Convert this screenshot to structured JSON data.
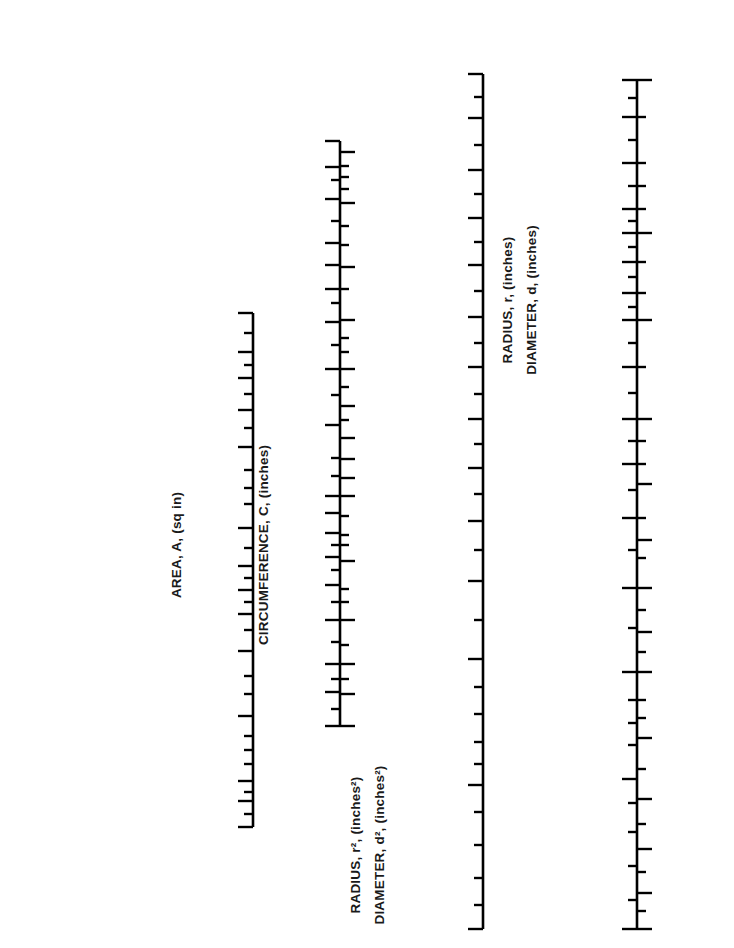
{
  "figure": {
    "type": "nomogram"
  },
  "formulas": [
    {
      "id": "f1",
      "lines": [
        "C = 6.2832r",
        "r = C/6.2832"
      ],
      "marker": "crosshair-icon"
    },
    {
      "id": "f2",
      "lines": [
        "C = 3.1416d",
        "d = C/3.1416"
      ],
      "marker": "crosshair-icon"
    },
    {
      "id": "f3",
      "lines": [
        "A = 7.854d",
        "2"
      ],
      "text": "A = 7.854d²",
      "marker": "crosshair-icon"
    },
    {
      "id": "f4",
      "lines": [
        "A = 3.1416r",
        "2"
      ],
      "text": "A = 3.1416r²",
      "marker": "crosshair-icon"
    }
  ],
  "examples": [
    {
      "label": "EXAMPLE 2",
      "id": "example-2"
    },
    {
      "label": "EXAMPLE 1",
      "id": "example-1"
    }
  ],
  "badges": [
    {
      "n": "1",
      "cx": 94,
      "cy": 193
    },
    {
      "n": "2",
      "cx": 245,
      "cy": 292
    },
    {
      "n": "3",
      "cx": 316,
      "cy": 110
    },
    {
      "n": "4",
      "cx": 357,
      "cy": 110
    },
    {
      "n": "5",
      "cx": 470,
      "cy": 44
    },
    {
      "n": "6",
      "cx": 608,
      "cy": 51
    },
    {
      "n": "7",
      "cx": 688,
      "cy": 51
    }
  ],
  "chart_data": {
    "type": "nomogram",
    "scales": [
      {
        "index": "2",
        "name": "AREA",
        "axis_title": "AREA, A, (sq in)",
        "unit": "sq in",
        "x": 253,
        "y_top": 313,
        "y_bottom": 827,
        "labels_side": "left",
        "major": [
          {
            "v": "700.0",
            "y": 313
          },
          {
            "v": "500.0",
            "y": 352
          },
          {
            "v": "400.0",
            "y": 378
          },
          {
            "v": "300.0",
            "y": 410
          },
          {
            "v": "200.0",
            "y": 447
          },
          {
            "v": "100.0",
            "y": 528
          },
          {
            "v": "50.0",
            "y": 566
          },
          {
            "v": "40.0",
            "y": 590
          },
          {
            "v": "30.0",
            "y": 614
          },
          {
            "v": "20.0",
            "y": 651
          },
          {
            "v": "10.0",
            "y": 716
          },
          {
            "v": "5.0",
            "y": 781
          },
          {
            "v": "4.0",
            "y": 801
          },
          {
            "v": "3.0",
            "y": 827
          }
        ],
        "minor_y": [
          333,
          365,
          394,
          428,
          470,
          488,
          504,
          548,
          578,
          602,
          630,
          676,
          694,
          736,
          750,
          764,
          792,
          814
        ]
      },
      {
        "index": "3",
        "name": "CIRCUMFERENCE",
        "axis_title": "CIRCUMFERENCE, C, (inches)",
        "unit": "inches",
        "x": 340,
        "y_top": 141,
        "y_bottom": 726,
        "labels_side": "left",
        "major": [
          {
            "v": "70.0",
            "y": 141
          },
          {
            "v": "60.0",
            "y": 167
          },
          {
            "v": "50.0",
            "y": 199
          },
          {
            "v": "40.0",
            "y": 243
          },
          {
            "v": "35.0",
            "y": 265
          },
          {
            "v": "30.0",
            "y": 289
          },
          {
            "v": "25.0",
            "y": 322
          },
          {
            "v": "20.0",
            "y": 369
          },
          {
            "v": "15.0",
            "y": 425
          },
          {
            "v": "10.0",
            "y": 496
          },
          {
            "v": "9.0",
            "y": 513
          },
          {
            "v": "8.0",
            "y": 533
          },
          {
            "v": "7.0",
            "y": 557
          },
          {
            "v": "6.0",
            "y": 585
          },
          {
            "v": "5.0",
            "y": 620
          },
          {
            "v": "4.0",
            "y": 664
          },
          {
            "v": "3.5",
            "y": 692
          },
          {
            "v": "3.0",
            "y": 726
          }
        ],
        "minor_y": [
          180,
          221,
          303,
          345,
          395,
          458,
          476,
          545,
          570,
          602,
          642,
          679,
          709
        ]
      },
      {
        "index": "4",
        "name": "RADIUS / DIAMETER",
        "axis_title_lines": [
          "RADIUS, r, (inches)",
          "DIAMETER, d, (inches)"
        ],
        "unit": "inches",
        "x": 340,
        "y_top": 141,
        "y_bottom": 726,
        "labels_side": "right",
        "major": [
          {
            "v": "0.15",
            "y": 152
          },
          {
            "v": "0.20",
            "y": 203
          },
          {
            "v": "0.30",
            "y": 267
          },
          {
            "v": "0.40",
            "y": 320
          },
          {
            "v": "0.50",
            "y": 369
          },
          {
            "v": "0.60",
            "y": 406
          },
          {
            "v": "0.70",
            "y": 438
          },
          {
            "v": "0.80",
            "y": 459
          },
          {
            "v": "0.90",
            "y": 478
          },
          {
            "v": "1.00",
            "y": 496
          },
          {
            "v": "1.50",
            "y": 561
          },
          {
            "v": "2.00",
            "y": 620
          },
          {
            "v": "2.50",
            "y": 664
          },
          {
            "v": "3.00",
            "y": 694
          },
          {
            "v": "3.50",
            "y": 726
          }
        ],
        "minor_y": [
          166,
          177,
          189,
          226,
          245,
          289,
          338,
          352,
          387,
          420,
          516,
          535,
          545,
          589,
          602,
          645,
          679
        ]
      },
      {
        "index": "5",
        "name": "RADIUS² / DIAMETER²",
        "axis_title_lines": [
          "RADIUS, r², (inches²)",
          "DIAMETER, d², (inches²)"
        ],
        "unit": "inches2",
        "x": 483,
        "y_top": 74,
        "y_bottom": 929,
        "labels_side": "left",
        "major": [
          {
            "v": "10.0",
            "y": 74
          },
          {
            "v": "9.0",
            "y": 118
          },
          {
            "v": "8.0",
            "y": 170
          },
          {
            "v": "7.0",
            "y": 218
          },
          {
            "v": "6.0",
            "y": 265
          },
          {
            "v": "5.0",
            "y": 317
          },
          {
            "v": "4.5",
            "y": 367
          },
          {
            "v": "4.0",
            "y": 419
          },
          {
            "v": "3.5",
            "y": 468
          },
          {
            "v": "3.0",
            "y": 521
          },
          {
            "v": "2.5",
            "y": 581
          },
          {
            "v": "2.0",
            "y": 659
          },
          {
            "v": "1.5",
            "y": 785
          },
          {
            "v": "1.0",
            "y": 929
          }
        ],
        "minor_y": [
          97,
          145,
          194,
          242,
          291,
          343,
          394,
          444,
          494,
          550,
          620,
          687,
          714,
          742,
          764,
          812,
          845,
          878,
          905
        ]
      },
      {
        "index": "6",
        "name": "RADIUS / DIAMETER",
        "axis_title_lines": [
          "RADIUS, r, (inches)",
          "DIAMETER, d, (inches)"
        ],
        "unit": "inches",
        "x": 637,
        "y_top": 80,
        "y_bottom": 929,
        "labels_side": "left",
        "major": [
          {
            "v": "10.00",
            "y": 80
          },
          {
            "v": "9.00",
            "y": 117
          },
          {
            "v": "8.00",
            "y": 163
          },
          {
            "v": "7.00",
            "y": 209
          },
          {
            "v": "6.50",
            "y": 233
          },
          {
            "v": "6.00",
            "y": 262
          },
          {
            "v": "5.50",
            "y": 293
          },
          {
            "v": "5.00",
            "y": 320
          },
          {
            "v": "4.50",
            "y": 367
          },
          {
            "v": "4.00",
            "y": 419
          },
          {
            "v": "3.50",
            "y": 464
          },
          {
            "v": "3.00",
            "y": 518
          },
          {
            "v": "2.50",
            "y": 588
          },
          {
            "v": "2.00",
            "y": 672
          },
          {
            "v": "1.50",
            "y": 779
          },
          {
            "v": "1.00",
            "y": 929
          }
        ],
        "minor_y": [
          98,
          140,
          186,
          221,
          247,
          277,
          307,
          343,
          393,
          441,
          490,
          550,
          628,
          700,
          723,
          745,
          803,
          832,
          866,
          900
        ]
      },
      {
        "index": "7",
        "name": "CIRCUMFERENCE",
        "axis_title": "CIRCUMFERENCE, C, (inches)",
        "unit": "inches",
        "x": 637,
        "y_top": 80,
        "y_bottom": 929,
        "labels_side": "right",
        "major": [
          {
            "v": "1.00",
            "y": 80
          },
          {
            "v": "1.50",
            "y": 233
          },
          {
            "v": "2.00",
            "y": 320
          },
          {
            "v": "2.50",
            "y": 419
          },
          {
            "v": "3.00",
            "y": 484
          },
          {
            "v": "3.50",
            "y": 540
          },
          {
            "v": "4.00",
            "y": 588
          },
          {
            "v": "4.50",
            "y": 632
          },
          {
            "v": "5.00",
            "y": 672
          },
          {
            "v": "6.00",
            "y": 738
          },
          {
            "v": "7.00",
            "y": 799
          },
          {
            "v": "8.00",
            "y": 849
          },
          {
            "v": "9.00",
            "y": 893
          },
          {
            "v": "10.00",
            "y": 929
          }
        ],
        "minor_y": [
          117,
          163,
          186,
          209,
          262,
          293,
          367,
          441,
          464,
          518,
          558,
          610,
          652,
          700,
          718,
          769,
          824,
          872,
          911
        ]
      }
    ],
    "example_lines": [
      {
        "name": "EXAMPLE 2",
        "anchor": {
          "x": 30,
          "y": 241
        },
        "points": [
          {
            "x": 30,
            "y": 241
          },
          {
            "x": 253,
            "y": 352
          },
          {
            "x": 340,
            "y": 406
          },
          {
            "x": 483,
            "y": 468
          },
          {
            "x": 637,
            "y": 540
          }
        ],
        "readings": {
          "area": "500.0",
          "circumference_3": "17.7",
          "radius_diameter_4": "0.60",
          "r2_d2_5": "3.5",
          "radius_diameter_6": "3.00",
          "circumference_7": "3.50"
        }
      },
      {
        "name": "EXAMPLE 1",
        "anchor": {
          "x": 30,
          "y": 714
        },
        "points": [
          {
            "x": 30,
            "y": 714
          },
          {
            "x": 253,
            "y": 759
          },
          {
            "x": 483,
            "y": 805
          }
        ],
        "readings": {
          "area": "7.0",
          "r2_d2_5": "1.4"
        }
      }
    ]
  }
}
